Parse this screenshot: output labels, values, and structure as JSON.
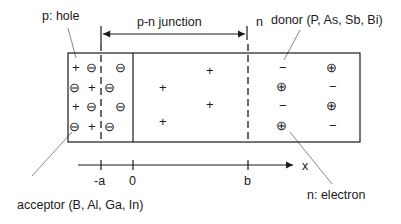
{
  "labels": {
    "p_hole": "p: hole",
    "pn_junction": "p-n junction",
    "n_region": "n",
    "donor": "donor (P, As, Sb, Bi)",
    "acceptor": "acceptor (B, Al, Ga, In)",
    "n_electron": "n: electron"
  },
  "axis": {
    "label": "x",
    "ticks": [
      "-a",
      "0",
      "b"
    ]
  },
  "symbols": {
    "plus": "+",
    "minus": "−",
    "circled_minus": "⊖",
    "circled_plus": "⊕"
  },
  "colors": {
    "line": "#1a1a1a",
    "leader": "#555555",
    "background": "#ffffff"
  }
}
